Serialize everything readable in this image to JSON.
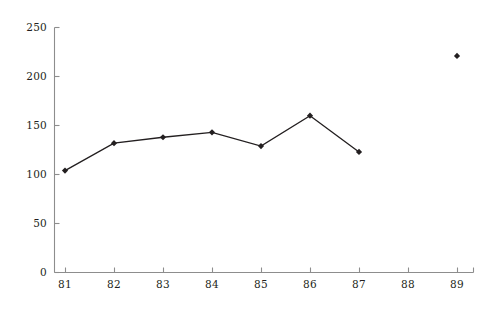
{
  "chart_data": {
    "type": "line",
    "title": "",
    "subtitle": "",
    "xlabel": "",
    "ylabel": "",
    "categories": [
      "81",
      "82",
      "83",
      "84",
      "85",
      "86",
      "87",
      "88",
      "89"
    ],
    "x": [
      81,
      82,
      83,
      84,
      85,
      86,
      87,
      88,
      89
    ],
    "series": [
      {
        "name": "series-1",
        "values": [
          104,
          132,
          138,
          143,
          129,
          160,
          123,
          null,
          221
        ],
        "marker": "diamond",
        "color": "#231f20",
        "connected_range": [
          "81",
          "87"
        ],
        "isolated_points": [
          {
            "x": "89",
            "y": 221
          }
        ]
      }
    ],
    "ylim": [
      0,
      250
    ],
    "yticks": [
      0,
      50,
      100,
      150,
      200,
      250
    ],
    "ytick_labels": [
      "0",
      "50",
      "100",
      "150",
      "200",
      "250"
    ],
    "xticks": [
      "81",
      "82",
      "83",
      "84",
      "85",
      "86",
      "87",
      "88",
      "89"
    ],
    "grid": false,
    "legend": null,
    "axis_color": "#8d8d8d",
    "line_color": "#231f20"
  },
  "caption": {
    "text": ""
  }
}
